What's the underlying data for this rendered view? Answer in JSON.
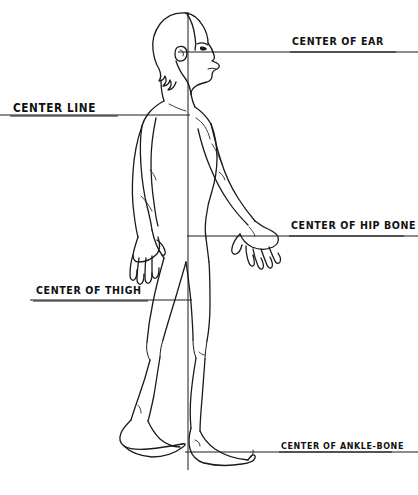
{
  "diagram": {
    "stroke_color": "#1a1a1a",
    "background_color": "#ffffff",
    "width": 418,
    "height": 495,
    "vertical_plumb_line": {
      "name": "vertical plumb line",
      "x": 188,
      "y_top": 12,
      "y_bottom": 470
    },
    "reference_lines": [
      {
        "id": "ear",
        "label": "CENTER OF EAR",
        "y": 52,
        "x_start": 178,
        "x_end": 418,
        "label_side": "right"
      },
      {
        "id": "center-line",
        "label": "CENTER LINE",
        "y": 115,
        "x_start": 0,
        "x_end": 190,
        "label_side": "left"
      },
      {
        "id": "hip-bone",
        "label": "CENTER OF HIP BONE",
        "y": 236,
        "x_start": 187,
        "x_end": 418,
        "label_side": "right"
      },
      {
        "id": "thigh",
        "label": "CENTER OF THIGH",
        "y": 300,
        "x_start": 30,
        "x_end": 192,
        "label_side": "left"
      },
      {
        "id": "ankle-bone",
        "label": "CENTER OF ANKLE-BONE",
        "y": 452,
        "x_start": 185,
        "x_end": 418,
        "label_side": "right"
      }
    ]
  }
}
